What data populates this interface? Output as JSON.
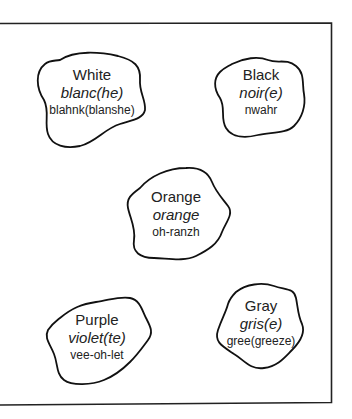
{
  "diagram": {
    "border_color": "#222222",
    "text_color": "#222222",
    "cards": [
      {
        "id": "white",
        "english": "White",
        "french": "blanc(he)",
        "pronunciation": "blahnk(blanshe)"
      },
      {
        "id": "black",
        "english": "Black",
        "french": "noir(e)",
        "pronunciation": "nwahr"
      },
      {
        "id": "orange",
        "english": "Orange",
        "french": "orange",
        "pronunciation": "oh-ranzh"
      },
      {
        "id": "purple",
        "english": "Purple",
        "french": "violet(te)",
        "pronunciation": "vee-oh-let"
      },
      {
        "id": "gray",
        "english": "Gray",
        "french": "gris(e)",
        "pronunciation": "gree(greeze)"
      }
    ]
  }
}
